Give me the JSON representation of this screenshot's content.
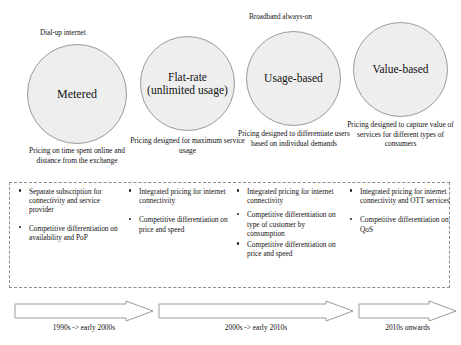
{
  "diagram": {
    "colors": {
      "circle_fill": "#eeeeee",
      "circle_stroke": "#9a9a9a",
      "box_border": "#8d8d8d",
      "arrow_stroke": "#8d8d8d",
      "text": "#111111",
      "background": "#ffffff"
    },
    "stages": [
      {
        "top_label": "Dial-up internet",
        "circle_label": "Metered",
        "caption": "Pricing on time spent online and distance from the exchange"
      },
      {
        "top_label": "",
        "circle_label": "Flat-rate (unlimited usage)",
        "caption": "Pricing designed for maximum service usage"
      },
      {
        "top_label": "Broadband always-on",
        "circle_label": "Usage-based",
        "caption": "Pricing designed to differentiate users based on individual demands"
      },
      {
        "top_label": "",
        "circle_label": "Value-based",
        "caption": "Pricing designed to capture value of services for different types of consumers"
      }
    ],
    "feature_columns": [
      {
        "items": [
          "Separate subscription for connectivity and service provider",
          "Competitive differentiation on availability and PoP"
        ]
      },
      {
        "items": [
          "Integrated pricing for internet connectivity",
          "Competitive differentiation on price and speed"
        ]
      },
      {
        "items": [
          "Integrated pricing for internet connectivity",
          "Competitive differentiation on type of customer by consumption",
          "Competitive differentiation on price and speed"
        ]
      },
      {
        "items": [
          "Integrated pricing for internet connectivity and OTT services",
          "Competitive differentiation on QoS"
        ]
      }
    ],
    "timeline": [
      {
        "label": "1990s -> early 2000s"
      },
      {
        "label": "2000s -> early 2010s"
      },
      {
        "label": "2010s onwards"
      }
    ]
  }
}
